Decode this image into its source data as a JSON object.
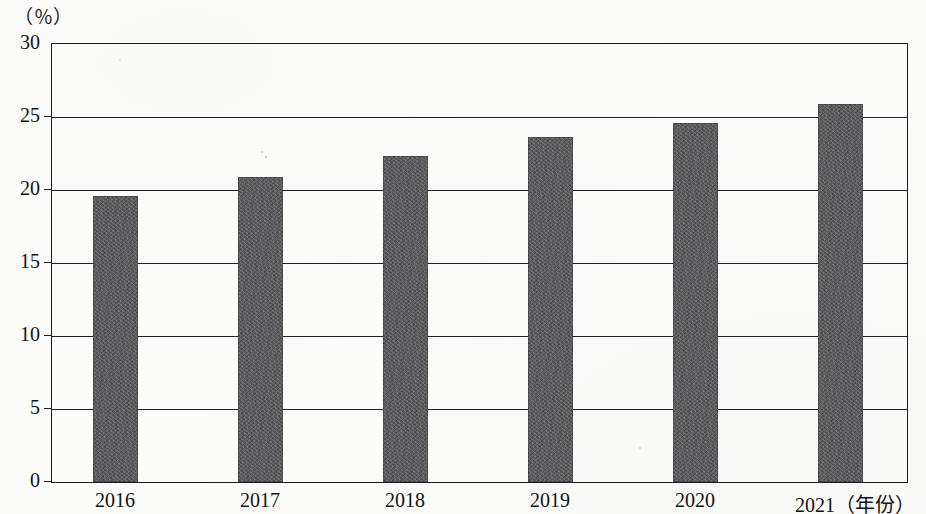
{
  "chart_data": {
    "type": "bar",
    "title": "",
    "subtitle": "",
    "xlabel": "（年份）",
    "ylabel": "（％）",
    "unit_label": "（％）",
    "categories": [
      "2016",
      "2017",
      "2018",
      "2019",
      "2020",
      "2021"
    ],
    "values": [
      19.6,
      20.9,
      22.3,
      23.6,
      24.6,
      25.9
    ],
    "series": [
      {
        "name": "",
        "values": [
          19.6,
          20.9,
          22.3,
          23.6,
          24.6,
          25.9
        ]
      }
    ],
    "ylim": [
      0,
      30
    ],
    "ytick_values": [
      0,
      5,
      10,
      15,
      20,
      25,
      30
    ],
    "ytick_labels": [
      "0",
      "5",
      "10",
      "15",
      "20",
      "25",
      "30"
    ],
    "xtick_labels": [
      "2016",
      "2017",
      "2018",
      "2019",
      "2020",
      "2021"
    ],
    "last_category_suffix": "（年份）",
    "grid": true,
    "grid_axis": "y",
    "legend": false,
    "legend_position": "none",
    "bar_color": "#5a5a5c",
    "axis_color": "#1b1b1e",
    "background_color": "#fcfcfa",
    "annotations": []
  },
  "axis": {
    "unit_label": "（％）",
    "x_unit_label": "（年份）"
  }
}
